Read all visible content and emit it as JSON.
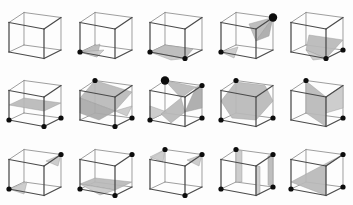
{
  "figure": {
    "grid_rows": 3,
    "grid_cols": 5,
    "total_panels": 15,
    "background_color": "#fdfdfd",
    "edge_color": "#5a5a5a",
    "section_fill_color": "#b9b9b9",
    "vertex_marker_color": "#0d0d0d",
    "projection": "axonometric"
  },
  "chart_data": {
    "type": "diagram",
    "rows": 3,
    "cols": 5,
    "cube_projection": {
      "comment": "Unit cube corner screen offsets within a panel, origin at panel top-left, in pixels",
      "corners": {
        "front_bottom_left": [
          9.0,
          52.0
        ],
        "front_bottom_right": [
          44.0,
          58.5
        ],
        "front_top_left": [
          9.0,
          22.5
        ],
        "front_top_right": [
          44.0,
          29.0
        ],
        "back_bottom_left": [
          24.0,
          45.0
        ],
        "back_bottom_right": [
          61.0,
          50.0
        ],
        "back_top_left": [
          24.0,
          12.5
        ],
        "back_top_right": [
          61.0,
          17.5
        ]
      },
      "edges": [
        [
          "front_bottom_left",
          "front_bottom_right",
          "front"
        ],
        [
          "front_bottom_right",
          "front_top_right",
          "front"
        ],
        [
          "front_top_right",
          "front_top_left",
          "front"
        ],
        [
          "front_top_left",
          "front_bottom_left",
          "front"
        ],
        [
          "back_bottom_left",
          "back_bottom_right",
          "back"
        ],
        [
          "back_bottom_right",
          "back_top_right",
          "back"
        ],
        [
          "back_top_right",
          "back_top_left",
          "back"
        ],
        [
          "back_top_left",
          "back_bottom_left",
          "back"
        ],
        [
          "front_bottom_left",
          "back_bottom_left",
          "back"
        ],
        [
          "front_bottom_right",
          "back_bottom_right",
          "front"
        ],
        [
          "front_top_left",
          "back_top_left",
          "back"
        ],
        [
          "front_top_right",
          "back_top_right",
          "front"
        ]
      ]
    },
    "panels": [
      {
        "index": 0,
        "row": 0,
        "col": 0,
        "label": "panel-r0-c0",
        "marked_vertices": [],
        "section_count": 0,
        "sections": []
      },
      {
        "index": 1,
        "row": 0,
        "col": 1,
        "label": "panel-r0-c1",
        "marked_vertices": [
          "front_bottom_left"
        ],
        "section_count": 2,
        "sections": [
          {
            "shade": "default",
            "points": "9,52 29,44 26,57"
          },
          {
            "shade": "light",
            "points": "9,52 26,57 33,50"
          }
        ]
      },
      {
        "index": 2,
        "row": 0,
        "col": 2,
        "label": "panel-r0-c2",
        "marked_vertices": [
          "front_bottom_left",
          "front_bottom_right"
        ],
        "section_count": 2,
        "sections": [
          {
            "shade": "default",
            "points": "9,52 24,45 52,49 44,58.5"
          },
          {
            "shade": "light",
            "points": "9,52 44,58.5 30,60"
          }
        ]
      },
      {
        "index": 3,
        "row": 0,
        "col": 3,
        "label": "panel-r0-c3",
        "marked_vertices": [
          "back_top_right",
          "front_bottom_left"
        ],
        "section_count": 3,
        "sections": [
          {
            "shade": "default",
            "points": "61,17.5 37,24 44,41"
          },
          {
            "shade": "dark",
            "points": "61,17.5 44,41 57,36"
          },
          {
            "shade": "light",
            "points": "9,52 26,47 22,58"
          }
        ]
      },
      {
        "index": 4,
        "row": 0,
        "col": 4,
        "label": "panel-r0-c4",
        "marked_vertices": [
          "front_bottom_right",
          "back_bottom_right"
        ],
        "section_count": 2,
        "sections": [
          {
            "shade": "default",
            "points": "27,35 61,40 44,58.5 24,50"
          },
          {
            "shade": "light",
            "points": "24,50 44,58.5 31,60"
          }
        ]
      },
      {
        "index": 5,
        "row": 1,
        "col": 0,
        "label": "panel-r1-c0",
        "marked_vertices": [
          "front_bottom_left",
          "front_bottom_right",
          "back_bottom_right"
        ],
        "section_count": 1,
        "sections": [
          {
            "shade": "default",
            "points": "9,37 24,30 61,35 44,43"
          }
        ]
      },
      {
        "index": 6,
        "row": 1,
        "col": 1,
        "label": "panel-r1-c1",
        "marked_vertices": [
          "back_top_left",
          "front_bottom_right",
          "back_bottom_right"
        ],
        "section_count": 3,
        "sections": [
          {
            "shade": "default",
            "points": "24,12.5 61,24 44,43 9,30"
          },
          {
            "shade": "dark",
            "points": "9,30 44,43 28,52 9,45"
          },
          {
            "shade": "light",
            "points": "44,43 61,38 56,48"
          }
        ]
      },
      {
        "index": 7,
        "row": 1,
        "col": 2,
        "label": "panel-r1-c2",
        "marked_vertices": [
          "back_top_left",
          "back_top_right",
          "front_bottom_left",
          "back_bottom_right"
        ],
        "section_count": 4,
        "sections": [
          {
            "shade": "default",
            "points": "24,12.5 55,19 40,30"
          },
          {
            "shade": "dark",
            "points": "55,19 61,17.5 61,40 44,44"
          },
          {
            "shade": "light",
            "points": "9,38 26,44 9,52"
          },
          {
            "shade": "default",
            "points": "20,46 40,30 44,44 30,55"
          }
        ]
      },
      {
        "index": 8,
        "row": 1,
        "col": 3,
        "label": "panel-r1-c3",
        "marked_vertices": [
          "back_top_left",
          "front_bottom_left",
          "back_bottom_right"
        ],
        "section_count": 1,
        "sections": [
          {
            "shade": "default",
            "points": "24,14 53,17.5 61,33 44,52 20,50 9,33"
          }
        ]
      },
      {
        "index": 9,
        "row": 1,
        "col": 4,
        "label": "panel-r1-c4",
        "marked_vertices": [
          "back_top_left",
          "back_bottom_right"
        ],
        "section_count": 2,
        "sections": [
          {
            "shade": "default",
            "points": "24,13 44,29 44,58.5 24,45"
          },
          {
            "shade": "light",
            "points": "44,29 61,17.5 61,40 44,45"
          }
        ]
      },
      {
        "index": 10,
        "row": 2,
        "col": 0,
        "label": "panel-r2-c0",
        "marked_vertices": [
          "front_bottom_left",
          "back_top_right"
        ],
        "section_count": 2,
        "sections": [
          {
            "shade": "light",
            "points": "9,52 27,45 24,57"
          },
          {
            "shade": "light",
            "points": "61,17.5 46,24 58,29"
          }
        ]
      },
      {
        "index": 11,
        "row": 2,
        "col": 1,
        "label": "panel-r2-c1",
        "marked_vertices": [
          "back_top_right",
          "front_bottom_left",
          "front_bottom_right"
        ],
        "section_count": 2,
        "sections": [
          {
            "shade": "default",
            "points": "9,47 24,41 61,45 44,53"
          },
          {
            "shade": "light",
            "points": "9,47 44,53 29,58"
          }
        ]
      },
      {
        "index": 12,
        "row": 2,
        "col": 2,
        "label": "panel-r2-c2",
        "marked_vertices": [
          "back_top_left",
          "back_top_right",
          "front_bottom_right"
        ],
        "section_count": 2,
        "sections": [
          {
            "shade": "light",
            "points": "24,12.5 9,20 22,25"
          },
          {
            "shade": "light",
            "points": "61,17.5 46,23 58,29"
          }
        ]
      },
      {
        "index": 13,
        "row": 2,
        "col": 3,
        "label": "panel-r2-c3",
        "marked_vertices": [
          "back_top_left",
          "back_top_right",
          "front_bottom_left",
          "back_bottom_right"
        ],
        "section_count": 3,
        "sections": [
          {
            "shade": "light",
            "points": "24,12.5 30,14 30,45 24,45"
          },
          {
            "shade": "default",
            "points": "56,19 61,17.5 61,50 56,48"
          },
          {
            "shade": "light",
            "points": "44,29 48,29.5 48,57 44,58.5"
          }
        ]
      },
      {
        "index": 14,
        "row": 2,
        "col": 4,
        "label": "panel-r2-c4",
        "marked_vertices": [
          "back_top_right",
          "front_bottom_left",
          "back_bottom_right"
        ],
        "section_count": 1,
        "sections": [
          {
            "shade": "default",
            "points": "61,17.5 44,29 44,58.5 9,45"
          }
        ]
      }
    ],
    "vertex_marker_sizes": {
      "normal": 2.6,
      "large": 4.2
    },
    "large_marker_panels": [
      3,
      7
    ]
  }
}
